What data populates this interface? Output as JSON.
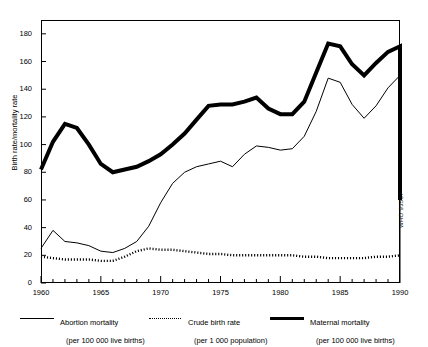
{
  "figure": {
    "clipped_title": "",
    "credit": "WHO 93537"
  },
  "axes": {
    "ylabel": "Birth rate/mortality rate",
    "yticks": [
      0,
      20,
      40,
      60,
      80,
      100,
      120,
      140,
      160,
      180
    ],
    "xticks_labeled": [
      1960,
      1965,
      1970,
      1975,
      1980,
      1985,
      1990
    ],
    "xtick_labels": [
      "1960",
      "1965",
      "1970",
      "1975",
      "1980",
      "1985",
      "1990"
    ],
    "ytick_labels": [
      "0",
      "20",
      "40",
      "60",
      "80",
      "100",
      "120",
      "140",
      "160",
      "180"
    ]
  },
  "legend": {
    "entries": [
      {
        "name": "abortion-mortality",
        "style": "thin-solid",
        "title": "Abortion mortality",
        "sub": "(per 100 000 live births)"
      },
      {
        "name": "crude-birth-rate",
        "style": "dotted",
        "title": "Crude birth rate",
        "sub": "(per 1 000 population)"
      },
      {
        "name": "maternal-mortality",
        "style": "thick-solid",
        "title": "Maternal mortality",
        "sub": "(per 100 000 live births)"
      }
    ]
  },
  "chart_data": {
    "type": "line",
    "title": "",
    "xlabel": "",
    "ylabel": "Birth rate/mortality rate",
    "xlim": [
      1960,
      1990
    ],
    "ylim": [
      0,
      190
    ],
    "grid": false,
    "legend_position": "below-axes",
    "x": [
      1960,
      1961,
      1962,
      1963,
      1964,
      1965,
      1966,
      1967,
      1968,
      1969,
      1970,
      1971,
      1972,
      1973,
      1974,
      1975,
      1976,
      1977,
      1978,
      1979,
      1980,
      1981,
      1982,
      1983,
      1984,
      1985,
      1986,
      1987,
      1988,
      1989,
      1990
    ],
    "series": [
      {
        "name": "Maternal mortality",
        "units": "per 100 000 live births",
        "style": "thick-solid",
        "values": [
          82,
          102,
          115,
          112,
          100,
          86,
          80,
          82,
          84,
          88,
          93,
          100,
          108,
          118,
          128,
          129,
          129,
          131,
          134,
          126,
          122,
          122,
          131,
          152,
          173,
          171,
          158,
          150,
          159,
          167,
          171
        ]
      },
      {
        "name": "Abortion mortality",
        "units": "per 100 000 live births",
        "style": "thin-solid",
        "values": [
          25,
          38,
          30,
          29,
          27,
          23,
          22,
          25,
          30,
          41,
          58,
          72,
          80,
          84,
          86,
          88,
          84,
          93,
          99,
          98,
          96,
          97,
          106,
          124,
          148,
          145,
          129,
          119,
          128,
          141,
          150
        ]
      },
      {
        "name": "Crude birth rate",
        "units": "per 1 000 population",
        "style": "dotted",
        "values": [
          19,
          18,
          17,
          17,
          17,
          16,
          16,
          19,
          23,
          25,
          24,
          24,
          23,
          22,
          21,
          21,
          20,
          20,
          20,
          20,
          20,
          20,
          19,
          19,
          18,
          18,
          18,
          18,
          19,
          19,
          20
        ]
      }
    ],
    "terminal_drop_1990": {
      "maternal_mortality": 60,
      "abortion_mortality": 5,
      "note": "both solid series fall steeply at the final 1990 point"
    }
  }
}
